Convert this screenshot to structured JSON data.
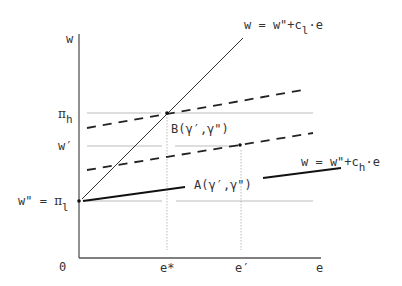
{
  "diagram": {
    "axes": {
      "y_label": "w",
      "x_label": "e",
      "origin_label": "0"
    },
    "y_ticks": [
      {
        "id": "pi_h",
        "greek": "π",
        "sub": "h",
        "y": 113
      },
      {
        "id": "w_prime",
        "label": "w′",
        "y": 146
      },
      {
        "id": "w_dprime",
        "label": "w\" = ",
        "greek": "π",
        "sub": "l",
        "y": 201
      }
    ],
    "x_ticks": [
      {
        "id": "e_star",
        "label": "e*",
        "x": 167
      },
      {
        "id": "e_prime",
        "label": "e′",
        "x": 241
      },
      {
        "id": "e",
        "label": "e",
        "x": 320
      }
    ],
    "lines": {
      "steep": {
        "label_prefix": "w = w\"+c",
        "label_sub": "l",
        "label_suffix": "·e"
      },
      "flat": {
        "label_prefix": "w = w\"+c",
        "label_sub": "h",
        "label_suffix": "·e"
      }
    },
    "points": {
      "B": {
        "label": "B(γ′,γ\")"
      },
      "A": {
        "label": "A(γ′,γ\")"
      }
    }
  }
}
